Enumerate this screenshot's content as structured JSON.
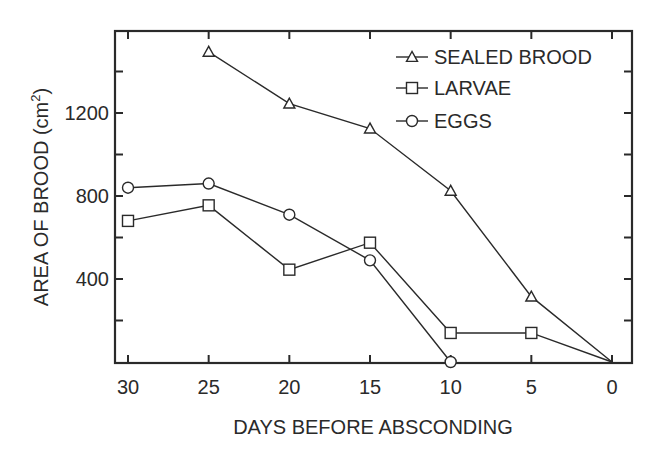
{
  "chart_data": {
    "type": "line",
    "title": "",
    "xlabel": "DAYS BEFORE ABSCONDING",
    "ylabel": "AREA OF BROOD (cm²)",
    "ylabel_main": "AREA OF BROOD (cm",
    "ylabel_sup": "2",
    "ylabel_close": ")",
    "x_ticks": [
      30,
      25,
      20,
      15,
      10,
      5,
      0
    ],
    "x_tick_labels": [
      "30",
      "25",
      "20",
      "15",
      "10",
      "5",
      "0"
    ],
    "x_reversed": true,
    "y_tick_labels": [
      "400",
      "800",
      "1200"
    ],
    "y_major_ticks": [
      400,
      800,
      1200
    ],
    "y_minor_ticks": [
      200,
      600,
      1000,
      1400
    ],
    "ylim": [
      0,
      1600
    ],
    "xlim": [
      31.5,
      -1.5
    ],
    "grid": false,
    "legend_position": "upper right",
    "series": [
      {
        "name": "SEALED BROOD",
        "marker": "triangle",
        "x": [
          25,
          20,
          15,
          10,
          5,
          0
        ],
        "values": [
          1495,
          1245,
          1125,
          825,
          315,
          0
        ]
      },
      {
        "name": "LARVAE",
        "marker": "square",
        "x": [
          30,
          25,
          20,
          15,
          10,
          5,
          0
        ],
        "values": [
          680,
          755,
          445,
          575,
          140,
          140,
          0
        ]
      },
      {
        "name": "EGGS",
        "marker": "circle",
        "x": [
          30,
          25,
          20,
          15,
          10
        ],
        "values": [
          840,
          860,
          710,
          490,
          0
        ]
      }
    ]
  },
  "colors": {
    "ink": "#2a2a2a",
    "background": "#ffffff"
  }
}
